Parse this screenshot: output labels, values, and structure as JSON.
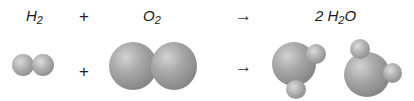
{
  "equation": {
    "reactant1": {
      "symbol": "H",
      "subscript": "2"
    },
    "plus1": "+",
    "reactant2": {
      "symbol": "O",
      "subscript": "2"
    },
    "arrow1": "→",
    "product": {
      "coefficient": "2",
      "symbol_h": "H",
      "subscript": "2",
      "symbol_o": "O"
    }
  },
  "models": {
    "plus2": "+",
    "arrow2": "→",
    "molecules": [
      "H2 molecule",
      "O2 molecule",
      "H2O molecule",
      "H2O molecule"
    ]
  },
  "colors": {
    "atom_gray": "#a8a8a8",
    "background": "#ffffff"
  }
}
